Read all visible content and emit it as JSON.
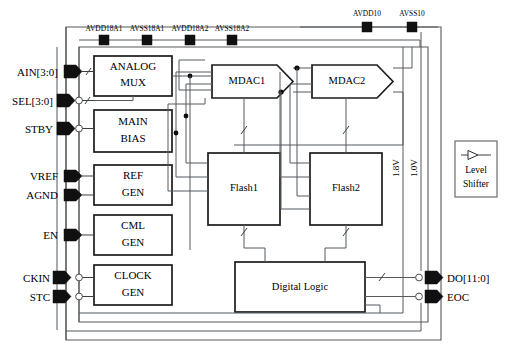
{
  "diagram": {
    "supply_rails_top": [
      {
        "name": "AVDD18A1",
        "x": 104
      },
      {
        "name": "AVSS18A1",
        "x": 147
      },
      {
        "name": "AVDD18A2",
        "x": 190
      },
      {
        "name": "AVSS18A2",
        "x": 232
      }
    ],
    "supply_rails_right": [
      {
        "name": "AVDD10",
        "x": 367
      },
      {
        "name": "AVSS10",
        "x": 412
      }
    ],
    "input_pins": [
      {
        "label": "AIN[3:0]",
        "bus": true
      },
      {
        "label": "SEL[3:0]",
        "bus": true
      },
      {
        "label": "STBY",
        "bus": false
      },
      {
        "label": "VREF",
        "bus": false
      },
      {
        "label": "AGND",
        "bus": false
      },
      {
        "label": "EN",
        "bus": false
      },
      {
        "label": "CKIN",
        "bus": false
      },
      {
        "label": "STC",
        "bus": false
      }
    ],
    "output_pins": [
      {
        "label": "DO[11:0]",
        "bus": true
      },
      {
        "label": "EOC",
        "bus": false
      }
    ],
    "analog_blocks": [
      {
        "id": "analog-mux",
        "line1": "ANALOG",
        "line2": "MUX"
      },
      {
        "id": "main-bias",
        "line1": "MAIN",
        "line2": "BIAS"
      },
      {
        "id": "ref-gen",
        "line1": "REF",
        "line2": "GEN"
      },
      {
        "id": "cml-gen",
        "line1": "CML",
        "line2": "GEN"
      },
      {
        "id": "clock-gen",
        "line1": "CLOCK",
        "line2": "GEN"
      }
    ],
    "mdac_blocks": [
      {
        "id": "mdac1",
        "label": "MDAC1"
      },
      {
        "id": "mdac2",
        "label": "MDAC2"
      }
    ],
    "flash_blocks": [
      {
        "id": "flash1",
        "label": "Flash1"
      },
      {
        "id": "flash2",
        "label": "Flash2"
      }
    ],
    "digital_block": {
      "id": "digital-logic",
      "label": "Digital Logic"
    },
    "voltage_domains": [
      {
        "label": "1.8V",
        "x": 403
      },
      {
        "label": "1.0V",
        "x": 421
      }
    ],
    "legend": {
      "line1": "Level",
      "line2": "Shifter",
      "symbol": "level-shifter-buffer"
    },
    "colors": {
      "ink": "#000000",
      "block_stroke": "#1c1c1c",
      "wire": "#555a5e",
      "frame": "#55585c",
      "pad": "#101010",
      "background": "#ffffff"
    }
  }
}
